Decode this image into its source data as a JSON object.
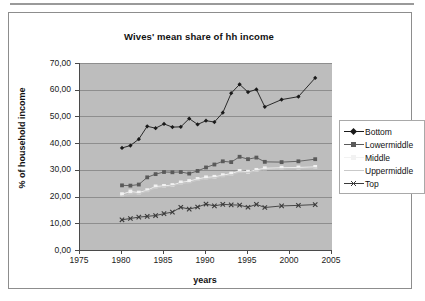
{
  "chart_data": {
    "type": "line",
    "title": "Wives' mean share of hh income",
    "xlabel": "years",
    "ylabel": "% of household income",
    "xlim": [
      1975,
      2005
    ],
    "ylim": [
      0,
      70
    ],
    "xticks": [
      "1975",
      "1980",
      "1985",
      "1990",
      "1995",
      "2000",
      "2005"
    ],
    "yticks": [
      "0,00",
      "10,00",
      "20,00",
      "30,00",
      "40,00",
      "50,00",
      "60,00",
      "70,00"
    ],
    "grid": "horizontal",
    "legend_position": "right",
    "plot_background": "#bdbdbd",
    "x": [
      1980,
      1981,
      1982,
      1983,
      1984,
      1985,
      1986,
      1987,
      1988,
      1989,
      1990,
      1991,
      1992,
      1993,
      1994,
      1995,
      1996,
      1997,
      1999,
      2001,
      2003
    ],
    "series": [
      {
        "name": "Bottom",
        "color": "#1a1a1a",
        "marker": "diamond",
        "values": [
          38.2,
          39.1,
          41.5,
          46.3,
          45.6,
          47.2,
          46.0,
          46.1,
          49.2,
          47.0,
          48.4,
          47.9,
          51.4,
          58.7,
          62.0,
          59.1,
          60.1,
          53.6,
          56.3,
          57.4,
          64.4
        ]
      },
      {
        "name": "Lowermiddle",
        "color": "#5a5a5a",
        "marker": "square",
        "values": [
          24.2,
          24.1,
          24.5,
          27.2,
          28.4,
          29.2,
          29.1,
          29.2,
          28.6,
          29.6,
          30.9,
          32.0,
          33.2,
          32.9,
          34.9,
          34.0,
          34.6,
          33.0,
          32.9,
          33.2,
          34.0
        ]
      },
      {
        "name": "Middle",
        "color": "#f2f2f2",
        "marker": "square",
        "values": [
          20.9,
          21.9,
          21.5,
          22.4,
          23.8,
          24.0,
          24.3,
          25.3,
          25.8,
          26.6,
          27.2,
          27.4,
          28.0,
          28.6,
          29.6,
          29.3,
          30.0,
          30.6,
          30.8,
          30.9,
          31.1
        ]
      },
      {
        "name": "Uppermiddle",
        "color": "#c9c9c9",
        "marker": "dash",
        "values": [
          20.2,
          21.0,
          21.0,
          22.0,
          23.2,
          23.6,
          24.0,
          24.8,
          25.2,
          26.1,
          26.6,
          27.0,
          27.6,
          28.1,
          29.1,
          29.0,
          29.6,
          30.1,
          30.3,
          30.5,
          30.7
        ]
      },
      {
        "name": "Top",
        "color": "#3a3a3a",
        "marker": "cross",
        "values": [
          11.3,
          11.8,
          12.3,
          12.6,
          12.9,
          13.6,
          14.2,
          16.0,
          15.3,
          16.1,
          17.2,
          16.5,
          17.1,
          16.9,
          16.8,
          16.0,
          17.1,
          15.9,
          16.5,
          16.7,
          17.0
        ]
      }
    ]
  },
  "legend": {
    "items": [
      {
        "label": "Bottom"
      },
      {
        "label": "Lowermiddle"
      },
      {
        "label": "Middle"
      },
      {
        "label": "Uppermiddle"
      },
      {
        "label": "Top"
      }
    ]
  }
}
